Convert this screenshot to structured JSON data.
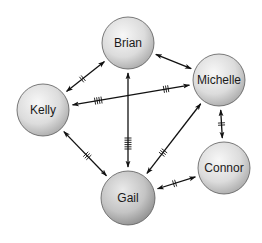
{
  "diagram": {
    "type": "network",
    "nodes": [
      {
        "id": "brian",
        "label": "Brian",
        "x": 128,
        "y": 43,
        "r": 26,
        "shade": "light"
      },
      {
        "id": "michelle",
        "label": "Michelle",
        "x": 219,
        "y": 80,
        "r": 26,
        "shade": "light"
      },
      {
        "id": "kelly",
        "label": "Kelly",
        "x": 43,
        "y": 110,
        "r": 26,
        "shade": "light"
      },
      {
        "id": "connor",
        "label": "Connor",
        "x": 224,
        "y": 168,
        "r": 26,
        "shade": "light"
      },
      {
        "id": "gail",
        "label": "Gail",
        "x": 128,
        "y": 198,
        "r": 27,
        "shade": "dark"
      }
    ],
    "edges": [
      {
        "from": "kelly",
        "to": "brian",
        "bidirectional": true,
        "hashes": [
          {
            "t": 0.42,
            "count": 2
          }
        ]
      },
      {
        "from": "brian",
        "to": "michelle",
        "bidirectional": true,
        "hashes": []
      },
      {
        "from": "kelly",
        "to": "michelle",
        "bidirectional": true,
        "hashes": [
          {
            "t": 0.22,
            "count": 4
          },
          {
            "t": 0.8,
            "count": 3
          }
        ]
      },
      {
        "from": "brian",
        "to": "gail",
        "bidirectional": true,
        "hashes": [
          {
            "t": 0.75,
            "count": 6
          }
        ]
      },
      {
        "from": "kelly",
        "to": "gail",
        "bidirectional": true,
        "hashes": [
          {
            "t": 0.55,
            "count": 3
          }
        ]
      },
      {
        "from": "michelle",
        "to": "gail",
        "bidirectional": true,
        "hashes": [
          {
            "t": 0.7,
            "count": 3
          }
        ]
      },
      {
        "from": "michelle",
        "to": "connor",
        "bidirectional": true,
        "hashes": [
          {
            "t": 0.5,
            "count": 2
          }
        ]
      },
      {
        "from": "connor",
        "to": "gail",
        "bidirectional": true,
        "hashes": [
          {
            "t": 0.55,
            "count": 2
          }
        ]
      }
    ]
  },
  "colors": {
    "node_light_highlight": "#f7f7f7",
    "node_light_mid": "#dcdcdc",
    "node_light_edge": "#a9a9a9",
    "node_dark_highlight": "#eaeaea",
    "node_dark_mid": "#c4c4c4",
    "node_dark_edge": "#8e8e8e",
    "edge": "#111111"
  }
}
